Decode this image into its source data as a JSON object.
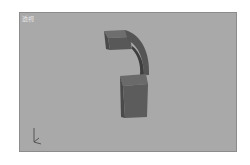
{
  "viewport": {
    "label": "透视",
    "background": "#a9a9a9",
    "object": {
      "name": "telephone-handset",
      "color": "#5a5a5a"
    },
    "gizmo_axes": [
      "x",
      "y",
      "z"
    ]
  }
}
